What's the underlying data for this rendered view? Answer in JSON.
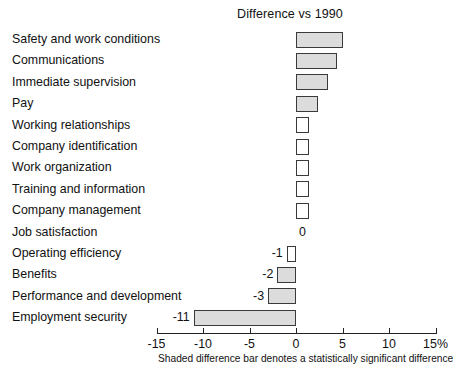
{
  "chart_data": {
    "type": "bar",
    "orientation": "horizontal",
    "title": "Difference vs 1990",
    "xlabel": "",
    "ylabel": "",
    "xlim": [
      -15,
      15
    ],
    "x_tick_labels": [
      "-15",
      "-10",
      "-5",
      "0",
      "5",
      "10",
      "15%"
    ],
    "x_ticks": [
      -15,
      -10,
      -5,
      0,
      5,
      10,
      15
    ],
    "grid": false,
    "legend": null,
    "footnote": "Shaded difference bar denotes a statistically significant difference",
    "categories": [
      "Safety and work conditions",
      "Communications",
      "Immediate supervision",
      "Pay",
      "Working relationships",
      "Company identification",
      "Work organization",
      "Training and information",
      "Company management",
      "Job satisfaction",
      "Operating efficiency",
      "Benefits",
      "Performance and development",
      "Employment security"
    ],
    "values": [
      5,
      4.4,
      3.4,
      2.4,
      1.4,
      1.4,
      1.4,
      1.4,
      1.4,
      0,
      -1,
      -2,
      -3,
      -11
    ],
    "value_labels": [
      "",
      "",
      "",
      "",
      "",
      "",
      "",
      "",
      "",
      "0",
      "-1",
      "-2",
      "-3",
      "-11"
    ],
    "significant": [
      true,
      true,
      true,
      true,
      false,
      false,
      false,
      false,
      false,
      false,
      false,
      true,
      true,
      true
    ],
    "bars": [
      {
        "category": "Safety and work conditions",
        "value": 5,
        "label": "",
        "significant": true
      },
      {
        "category": "Communications",
        "value": 4.4,
        "label": "",
        "significant": true
      },
      {
        "category": "Immediate supervision",
        "value": 3.4,
        "label": "",
        "significant": true
      },
      {
        "category": "Pay",
        "value": 2.4,
        "label": "",
        "significant": true
      },
      {
        "category": "Working relationships",
        "value": 1.4,
        "label": "",
        "significant": false
      },
      {
        "category": "Company identification",
        "value": 1.4,
        "label": "",
        "significant": false
      },
      {
        "category": "Work organization",
        "value": 1.4,
        "label": "",
        "significant": false
      },
      {
        "category": "Training and information",
        "value": 1.4,
        "label": "",
        "significant": false
      },
      {
        "category": "Company management",
        "value": 1.4,
        "label": "",
        "significant": false
      },
      {
        "category": "Job satisfaction",
        "value": 0,
        "label": "0",
        "significant": false
      },
      {
        "category": "Operating efficiency",
        "value": -1,
        "label": "-1",
        "significant": false
      },
      {
        "category": "Benefits",
        "value": -2,
        "label": "-2",
        "significant": true
      },
      {
        "category": "Performance and development",
        "value": -3,
        "label": "-3",
        "significant": true
      },
      {
        "category": "Employment security",
        "value": -11,
        "label": "-11",
        "significant": true
      }
    ],
    "colors": {
      "shaded_bar_fill": "#dcdcdc",
      "plain_bar_fill": "#ffffff",
      "bar_outline": "#3a3a3a",
      "axis": "#222222",
      "text": "#111111",
      "background": "#ffffff"
    }
  }
}
